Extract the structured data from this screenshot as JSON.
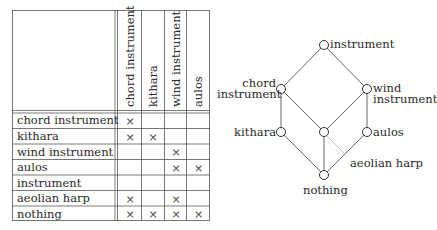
{
  "context_table": {
    "attributes": [
      "chord instrument",
      "kithara",
      "wind instrument",
      "aulos"
    ],
    "objects": [
      {
        "label": "chord instrument",
        "marks": [
          true,
          false,
          false,
          false
        ]
      },
      {
        "label": "kithara",
        "marks": [
          true,
          true,
          false,
          false
        ]
      },
      {
        "label": "wind instrument",
        "marks": [
          false,
          false,
          true,
          false
        ]
      },
      {
        "label": "aulos",
        "marks": [
          false,
          false,
          true,
          true
        ]
      },
      {
        "label": "instrument",
        "marks": [
          false,
          false,
          false,
          false
        ]
      },
      {
        "label": "aeolian harp",
        "marks": [
          true,
          false,
          true,
          false
        ]
      },
      {
        "label": "nothing",
        "marks": [
          true,
          true,
          true,
          true
        ]
      }
    ],
    "mark_symbol": "×"
  },
  "lattice": {
    "nodes": [
      {
        "id": "top",
        "label": "instrument"
      },
      {
        "id": "chord",
        "label": "chord instrument",
        "label_lines": [
          "chord",
          "instrument"
        ]
      },
      {
        "id": "wind",
        "label": "wind instrument",
        "label_lines": [
          "wind",
          "instrument"
        ]
      },
      {
        "id": "kithara",
        "label": "kithara"
      },
      {
        "id": "middle",
        "label": ""
      },
      {
        "id": "aulos",
        "label": "aulos"
      },
      {
        "id": "bottom",
        "label": "nothing"
      }
    ],
    "edges": [
      [
        "top",
        "chord"
      ],
      [
        "top",
        "wind"
      ],
      [
        "chord",
        "kithara"
      ],
      [
        "chord",
        "middle"
      ],
      [
        "wind",
        "middle"
      ],
      [
        "wind",
        "aulos"
      ],
      [
        "kithara",
        "bottom"
      ],
      [
        "middle",
        "bottom"
      ],
      [
        "aulos",
        "bottom"
      ]
    ],
    "annotation": {
      "label": "aeolian harp",
      "attached_to": "middle"
    }
  }
}
